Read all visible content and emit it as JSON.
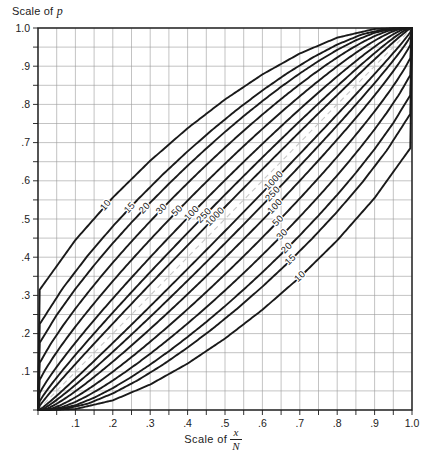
{
  "chart_data": {
    "type": "line",
    "title": "",
    "xlabel": "Scale of x/N",
    "ylabel": "Scale of p",
    "xlabel_prefix": "Scale of",
    "xlabel_numerator": "x",
    "xlabel_denominator": "N",
    "ylabel_prefix": "Scale of",
    "ylabel_symbol": "p",
    "xlim": [
      0,
      1
    ],
    "ylim": [
      0,
      1
    ],
    "grid": true,
    "grid_step": 0.05,
    "tick_step": 0.1,
    "legend": "none",
    "confidence_level": 0.95,
    "x_ticks": [
      0,
      0.1,
      0.2,
      0.3,
      0.4,
      0.5,
      0.6,
      0.7,
      0.8,
      0.9,
      1.0
    ],
    "x_tick_labels": [
      "",
      ".1",
      ".2",
      ".3",
      ".4",
      ".5",
      ".6",
      ".7",
      ".8",
      ".9",
      "1.0"
    ],
    "y_ticks": [
      0,
      0.1,
      0.2,
      0.3,
      0.4,
      0.5,
      0.6,
      0.7,
      0.8,
      0.9,
      1.0
    ],
    "y_tick_labels": [
      "",
      ".1",
      ".2",
      ".3",
      ".4",
      ".5",
      ".6",
      ".7",
      ".8",
      ".9",
      "1.0"
    ],
    "series": [
      {
        "name": "10",
        "n": 10,
        "label": "10"
      },
      {
        "name": "15",
        "n": 15,
        "label": "15"
      },
      {
        "name": "20",
        "n": 20,
        "label": "20"
      },
      {
        "name": "30",
        "n": 30,
        "label": "30"
      },
      {
        "name": "50",
        "n": 50,
        "label": "50"
      },
      {
        "name": "100",
        "n": 100,
        "label": "100"
      },
      {
        "name": "250",
        "n": 250,
        "label": "250"
      },
      {
        "name": "1000",
        "n": 1000,
        "label": "1000"
      }
    ],
    "upper_curve_labels": [
      "10",
      "15",
      "20",
      "30",
      "50",
      "100",
      "250",
      "1000"
    ],
    "lower_curve_labels": [
      "1000",
      "250",
      "100",
      "50",
      "30",
      "20",
      "15",
      "10"
    ],
    "diagonal_reference_line": true,
    "converge_points": [
      [
        0,
        0
      ],
      [
        1,
        1
      ]
    ]
  },
  "colors": {
    "curve": "#1a1a1a",
    "grid": "#9a9a9a",
    "axis": "#1a1a1a",
    "text": "#222222",
    "background": "#ffffff",
    "diagonal": "#c8c8c8"
  },
  "plot_box": {
    "left": 38,
    "top": 28,
    "right": 412,
    "bottom": 410
  }
}
